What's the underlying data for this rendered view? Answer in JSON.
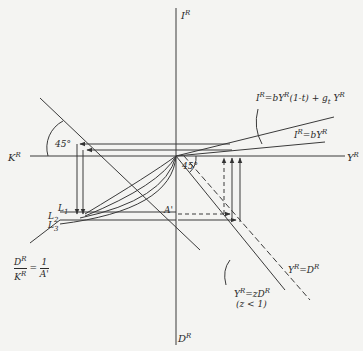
{
  "diagram": {
    "axes": {
      "top": "I",
      "top_sup": "R",
      "right": "Y",
      "right_sup": "R",
      "left": "K",
      "left_sup": "R",
      "bottom": "D",
      "bottom_sup": "R"
    },
    "curves": {
      "investment_total": {
        "lhs": "I",
        "lhs_sup": "R",
        "rhs": "=bY",
        "rhs_sup": "R",
        "rhs2": "(1-t) + g",
        "rhs2_sub": "t",
        "rhs3": " Y",
        "rhs3_sup": "R"
      },
      "investment_simple": {
        "lhs": "I",
        "lhs_sup": "R",
        "rhs": "=bY",
        "rhs_sup": "R"
      },
      "output_demand": {
        "lhs": "Y",
        "lhs_sup": "R",
        "rhs": "=D",
        "rhs_sup": "R"
      },
      "output_z_demand": {
        "lhs": "Y",
        "lhs_sup": "R",
        "rhs": "=zD",
        "rhs_sup": "R",
        "condition": "(z < 1)"
      },
      "ratio": {
        "num": "D",
        "num_sup": "R",
        "den": "K",
        "den_sup": "R",
        "eq": "=",
        "rnum": "1",
        "rden": "A'"
      }
    },
    "angles": {
      "upper_left": "45°",
      "center": "45°"
    },
    "markers": {
      "L1": "L",
      "L1_sub": "1",
      "L2": "L",
      "L2_sub": "2",
      "L3": "L",
      "L3_sub": "3",
      "A_prime": "A'"
    },
    "colors": {
      "ink": "#3a3a3a",
      "paper": "#f4f4f2"
    }
  }
}
